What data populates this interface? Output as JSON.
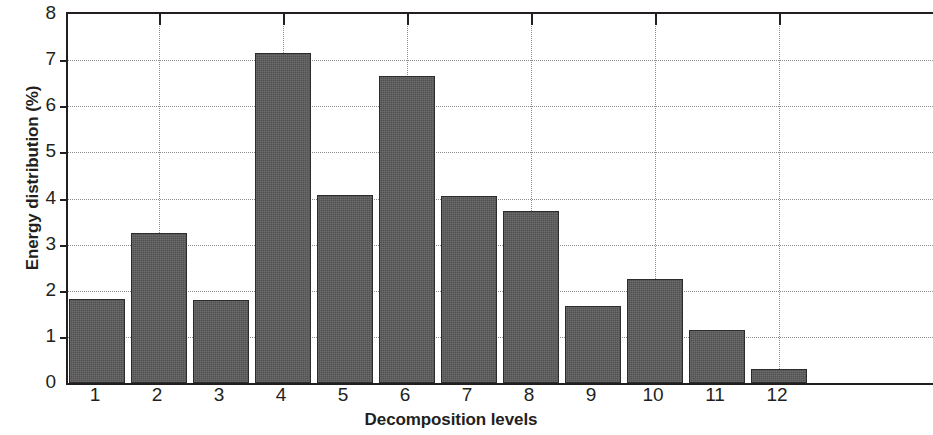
{
  "chart_data": {
    "type": "bar",
    "title": "",
    "xlabel": "Decomposition levels",
    "ylabel": "Energy distribution (%)",
    "categories": [
      "1",
      "2",
      "3",
      "4",
      "5",
      "6",
      "7",
      "8",
      "9",
      "10",
      "11",
      "12"
    ],
    "values": [
      1.82,
      3.26,
      1.81,
      7.15,
      4.07,
      6.66,
      4.06,
      3.74,
      1.68,
      2.26,
      1.16,
      0.31
    ],
    "ylim": [
      0,
      8
    ],
    "yticks": [
      0,
      1,
      2,
      3,
      4,
      5,
      6,
      7,
      8
    ],
    "ytick_labels": [
      "0",
      "1",
      "2",
      "3",
      "4",
      "5",
      "6",
      "7",
      "8"
    ],
    "grid": "dotted both axes",
    "legend": "none",
    "bar_color": "#5b5b5b",
    "bar_edge_color": "#2c2c2c",
    "axis_color": "#231f20",
    "grid_color": "#8c8c8c",
    "background": "#ffffff"
  }
}
